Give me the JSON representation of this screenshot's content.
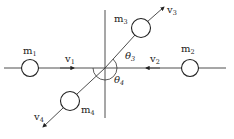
{
  "diagram": {
    "type": "two-dimensional elastic collision",
    "masses": [
      {
        "id": "m1",
        "label": "m",
        "sub": "1",
        "velocity_label": "v",
        "velocity_sub": "1",
        "direction": "right"
      },
      {
        "id": "m2",
        "label": "m",
        "sub": "2",
        "velocity_label": "v",
        "velocity_sub": "2",
        "direction": "left"
      },
      {
        "id": "m3",
        "label": "m",
        "sub": "3",
        "velocity_label": "v",
        "velocity_sub": "3",
        "direction": "up-right"
      },
      {
        "id": "m4",
        "label": "m",
        "sub": "4",
        "velocity_label": "v",
        "velocity_sub": "4",
        "direction": "down-left"
      }
    ],
    "angles": [
      {
        "id": "theta3",
        "label": "θ",
        "sub": "3"
      },
      {
        "id": "theta4",
        "label": "θ",
        "sub": "4"
      }
    ],
    "colors": {
      "ink": "#1a1a1a",
      "background": "#ffffff"
    }
  }
}
